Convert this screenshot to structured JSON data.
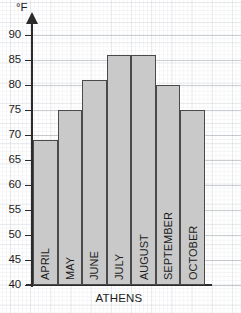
{
  "chart_data": {
    "type": "bar",
    "title": "",
    "subtitle": "",
    "xlabel": "ATHENS",
    "ylabel": "°F",
    "categories": [
      "APRIL",
      "MAY",
      "JUNE",
      "JULY",
      "AUGUST",
      "SEPTEMBER",
      "OCTOBER"
    ],
    "values": [
      69,
      75,
      81,
      86,
      86,
      80,
      75
    ],
    "ylim": [
      40,
      90
    ],
    "ytick_labels": [
      "90",
      "85",
      "80",
      "75",
      "70",
      "65",
      "60",
      "55",
      "50",
      "45",
      "40"
    ],
    "ytick_values": [
      90,
      85,
      80,
      75,
      70,
      65,
      60,
      55,
      50,
      45,
      40
    ],
    "ytick_step": 5,
    "grid": true,
    "legend": false,
    "legend_position": "none",
    "series": [
      {
        "name": "Average high temperature",
        "values": [
          69,
          75,
          81,
          86,
          86,
          80,
          75
        ]
      }
    ],
    "annotations": []
  },
  "style": {
    "bar_fill": "#c9c9c9",
    "bar_stroke": "#4a4a4a",
    "axis_color": "#2b2b2b",
    "grid_color": "#96a0aa",
    "text_color": "#1c1c1c",
    "background": "#ffffff"
  }
}
